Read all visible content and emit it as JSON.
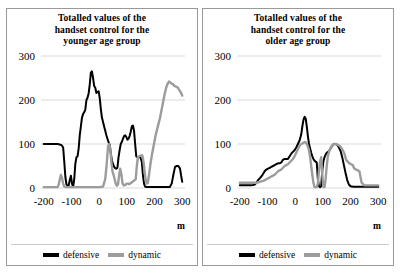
{
  "figure": {
    "background_color": "#ffffff",
    "panel_border_color": "#9a9a9a"
  },
  "colors": {
    "defensive": "#000000",
    "dynamic": "#9c9c9c",
    "gridline": "#d9d9d9",
    "axis": "#bfbfbf"
  },
  "panels": [
    {
      "id": "younger",
      "title": "Totalled values of the handset control for the younger age group",
      "title_lines": [
        "Totalled values of the",
        "handset control for the",
        "younger age group"
      ],
      "x_axis_label": "m",
      "legend": [
        {
          "label": "defensive",
          "color": "#000000"
        },
        {
          "label": "dynamic",
          "color": "#9c9c9c"
        }
      ]
    },
    {
      "id": "older",
      "title": "Totalled values of the handset control for the older age group",
      "title_lines": [
        "Totalled values of the",
        "handset control for the",
        "older age group"
      ],
      "x_axis_label": "m",
      "legend": [
        {
          "label": "defensive",
          "color": "#000000"
        },
        {
          "label": "dynamic",
          "color": "#9c9c9c"
        }
      ]
    }
  ],
  "chart_data": [
    {
      "type": "line",
      "title": "Totalled values of the handset control for the younger age group",
      "xlabel": "m",
      "ylabel": "",
      "xlim": [
        -210,
        310
      ],
      "ylim": [
        0,
        300
      ],
      "xticks": [
        -200,
        -100,
        0,
        100,
        200,
        300
      ],
      "yticks": [
        0,
        100,
        200,
        300
      ],
      "grid": true,
      "legend_position": "bottom",
      "series": [
        {
          "name": "defensive",
          "color": "#000000",
          "x": [
            -200,
            -180,
            -160,
            -150,
            -143,
            -138,
            -134,
            -130,
            -126,
            -122,
            -118,
            -114,
            -110,
            -106,
            -102,
            -98,
            -94,
            -90,
            -86,
            -82,
            -78,
            -74,
            -70,
            -66,
            -62,
            -58,
            -54,
            -50,
            -46,
            -42,
            -38,
            -34,
            -30,
            -26,
            -22,
            -18,
            -14,
            -10,
            -6,
            -2,
            2,
            6,
            10,
            14,
            18,
            22,
            26,
            30,
            34,
            38,
            42,
            46,
            50,
            54,
            58,
            62,
            66,
            70,
            74,
            78,
            82,
            86,
            90,
            94,
            98,
            102,
            106,
            110,
            114,
            118,
            122,
            126,
            130,
            134,
            138,
            142,
            146,
            150,
            154,
            158,
            162,
            166,
            170,
            174,
            178,
            182,
            190,
            200,
            220,
            240,
            255,
            262,
            268,
            274,
            280,
            286,
            292,
            296,
            300
          ],
          "y": [
            100,
            100,
            100,
            100,
            99,
            98,
            96,
            92,
            60,
            25,
            8,
            5,
            6,
            18,
            28,
            10,
            2,
            20,
            55,
            70,
            72,
            90,
            120,
            140,
            160,
            168,
            172,
            178,
            200,
            205,
            215,
            235,
            262,
            265,
            250,
            232,
            228,
            216,
            218,
            220,
            205,
            180,
            160,
            150,
            140,
            130,
            120,
            112,
            104,
            98,
            80,
            62,
            55,
            48,
            45,
            44,
            46,
            70,
            86,
            100,
            105,
            112,
            118,
            120,
            116,
            110,
            112,
            118,
            128,
            140,
            142,
            130,
            100,
            72,
            70,
            70,
            70,
            68,
            60,
            30,
            10,
            3,
            2,
            2,
            2,
            2,
            2,
            2,
            2,
            2,
            2,
            10,
            30,
            48,
            50,
            50,
            44,
            28,
            14
          ]
        },
        {
          "name": "dynamic",
          "color": "#9c9c9c",
          "x": [
            -200,
            -180,
            -160,
            -150,
            -146,
            -142,
            -138,
            -134,
            -130,
            -126,
            -120,
            -110,
            -100,
            -80,
            -60,
            -40,
            -20,
            0,
            14,
            22,
            28,
            32,
            36,
            40,
            44,
            48,
            52,
            56,
            60,
            64,
            68,
            72,
            76,
            80,
            84,
            88,
            92,
            96,
            100,
            104,
            108,
            112,
            116,
            120,
            124,
            128,
            132,
            136,
            140,
            144,
            148,
            152,
            156,
            160,
            164,
            168,
            172,
            176,
            180,
            186,
            192,
            198,
            204,
            212,
            220,
            228,
            236,
            242,
            248,
            252,
            256,
            260,
            266,
            272,
            278,
            284,
            290,
            296,
            300
          ],
          "y": [
            2,
            2,
            2,
            2,
            8,
            20,
            30,
            22,
            10,
            3,
            2,
            2,
            2,
            2,
            2,
            2,
            2,
            2,
            3,
            20,
            60,
            95,
            100,
            90,
            60,
            38,
            30,
            20,
            10,
            5,
            8,
            28,
            44,
            32,
            12,
            6,
            6,
            8,
            10,
            10,
            9,
            10,
            12,
            14,
            16,
            18,
            20,
            50,
            70,
            72,
            73,
            74,
            74,
            60,
            38,
            18,
            10,
            12,
            30,
            58,
            80,
            100,
            120,
            140,
            160,
            186,
            212,
            228,
            238,
            242,
            240,
            238,
            236,
            232,
            230,
            228,
            222,
            216,
            210
          ]
        }
      ]
    },
    {
      "type": "line",
      "title": "Totalled values of the handset control for the older age group",
      "xlabel": "m",
      "ylabel": "",
      "xlim": [
        -210,
        310
      ],
      "ylim": [
        0,
        300
      ],
      "xticks": [
        -200,
        -100,
        0,
        100,
        200,
        300
      ],
      "yticks": [
        0,
        100,
        200,
        300
      ],
      "grid": true,
      "legend_position": "bottom",
      "series": [
        {
          "name": "defensive",
          "color": "#000000",
          "x": [
            -200,
            -190,
            -180,
            -170,
            -160,
            -152,
            -146,
            -140,
            -134,
            -128,
            -122,
            -116,
            -110,
            -104,
            -98,
            -92,
            -86,
            -80,
            -74,
            -68,
            -62,
            -56,
            -50,
            -44,
            -38,
            -32,
            -26,
            -20,
            -14,
            -8,
            -2,
            4,
            10,
            16,
            22,
            26,
            30,
            34,
            38,
            42,
            46,
            50,
            54,
            58,
            62,
            66,
            70,
            74,
            78,
            82,
            86,
            90,
            94,
            98,
            102,
            106,
            110,
            114,
            118,
            122,
            126,
            130,
            134,
            140,
            146,
            152,
            158,
            164,
            170,
            176,
            182,
            188,
            194,
            200,
            210,
            220,
            240,
            260,
            280,
            300
          ],
          "y": [
            6,
            6,
            6,
            6,
            6,
            7,
            8,
            12,
            18,
            22,
            26,
            32,
            38,
            42,
            44,
            46,
            48,
            50,
            52,
            54,
            56,
            56,
            58,
            64,
            66,
            66,
            66,
            72,
            78,
            82,
            86,
            92,
            100,
            108,
            122,
            140,
            155,
            162,
            158,
            140,
            118,
            100,
            90,
            80,
            72,
            66,
            62,
            60,
            58,
            20,
            4,
            2,
            4,
            40,
            60,
            70,
            76,
            80,
            82,
            84,
            88,
            92,
            96,
            100,
            100,
            98,
            92,
            84,
            70,
            52,
            34,
            18,
            8,
            4,
            3,
            3,
            3,
            3,
            3,
            3
          ]
        },
        {
          "name": "dynamic",
          "color": "#9c9c9c",
          "x": [
            -200,
            -190,
            -180,
            -170,
            -160,
            -152,
            -146,
            -140,
            -134,
            -128,
            -122,
            -116,
            -110,
            -104,
            -98,
            -92,
            -86,
            -80,
            -74,
            -68,
            -62,
            -56,
            -50,
            -44,
            -38,
            -32,
            -26,
            -20,
            -14,
            -8,
            -2,
            4,
            10,
            16,
            22,
            28,
            34,
            38,
            42,
            46,
            50,
            54,
            58,
            62,
            66,
            70,
            74,
            78,
            82,
            86,
            90,
            94,
            98,
            102,
            106,
            110,
            114,
            118,
            124,
            130,
            136,
            142,
            148,
            154,
            160,
            166,
            172,
            178,
            184,
            190,
            196,
            202,
            208,
            214,
            220,
            226,
            232,
            240,
            250,
            260,
            280,
            300
          ],
          "y": [
            12,
            12,
            12,
            12,
            12,
            12,
            12,
            12,
            13,
            14,
            15,
            16,
            18,
            20,
            22,
            24,
            26,
            28,
            30,
            34,
            38,
            40,
            42,
            46,
            50,
            52,
            54,
            58,
            62,
            66,
            72,
            80,
            88,
            96,
            100,
            102,
            104,
            104,
            100,
            94,
            86,
            70,
            50,
            30,
            12,
            2,
            2,
            2,
            10,
            40,
            60,
            70,
            30,
            2,
            2,
            20,
            50,
            72,
            86,
            94,
            98,
            100,
            100,
            98,
            96,
            92,
            86,
            78,
            64,
            60,
            56,
            54,
            52,
            44,
            42,
            40,
            38,
            12,
            6,
            6,
            6,
            6
          ]
        }
      ]
    }
  ]
}
